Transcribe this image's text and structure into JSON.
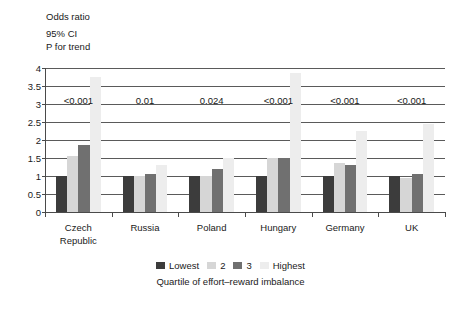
{
  "header_note": {
    "line_1": "Odds ratio",
    "line_2": "95% CI",
    "line_3": "P for trend"
  },
  "legend": {
    "items": [
      {
        "label": "Lowest",
        "color": "#3c3c3c"
      },
      {
        "label": "2",
        "color": "#d6d6d6"
      },
      {
        "label": "3",
        "color": "#707070"
      },
      {
        "label": "Highest",
        "color": "#ededed"
      }
    ]
  },
  "axis_caption": "Quartile of effort–reward imbalance",
  "chart_data": {
    "type": "bar",
    "title": "",
    "subtitle": "",
    "xlabel": "Quartile of effort–reward imbalance",
    "ylabel": "Odds ratio",
    "ylim": [
      0,
      4
    ],
    "yticks": [
      0,
      0.5,
      1,
      1.5,
      2,
      2.5,
      3,
      3.5,
      4
    ],
    "ytick_labels": [
      "0",
      "0.5",
      "1",
      "1.5",
      "2",
      "2.5",
      "3",
      "3.5",
      "4"
    ],
    "grid": true,
    "legend_position": "bottom",
    "categories": [
      "Czech Republic",
      "Russia",
      "Poland",
      "Hungary",
      "Germany",
      "UK"
    ],
    "series": [
      {
        "name": "Lowest",
        "color": "#3c3c3c",
        "values": [
          1.0,
          1.0,
          1.0,
          1.0,
          1.0,
          1.0
        ]
      },
      {
        "name": "2",
        "color": "#d6d6d6",
        "values": [
          1.55,
          1.0,
          1.0,
          1.5,
          1.35,
          0.95
        ]
      },
      {
        "name": "3",
        "color": "#707070",
        "values": [
          1.85,
          1.05,
          1.2,
          1.5,
          1.3,
          1.05
        ]
      },
      {
        "name": "Highest",
        "color": "#ededed",
        "values": [
          3.75,
          1.3,
          1.5,
          3.85,
          2.25,
          2.45
        ]
      }
    ],
    "annotations": {
      "label": "P for trend",
      "values": [
        "<0.001",
        "0.01",
        "0.024",
        "<0.001",
        "<0.001",
        "<0.001"
      ]
    }
  }
}
